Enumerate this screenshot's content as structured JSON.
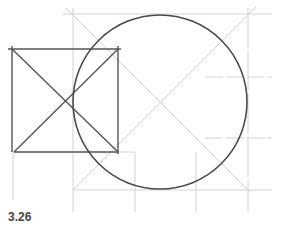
{
  "figure": {
    "caption": "3.26",
    "colors": {
      "construction_line": "#cfcfcf",
      "object_line": "#555555",
      "circle": "#4a4a4a",
      "caption": "#444444"
    },
    "square": {
      "x1": 12,
      "y1": 49,
      "x2": 118,
      "y2": 152
    },
    "circle": {
      "cx": 160,
      "cy": 102,
      "r": 87
    },
    "construction_box": {
      "x1": 73,
      "y1": 14,
      "x2": 248,
      "y2": 190
    },
    "guide_lines": {
      "vertical_x": [
        13,
        73,
        135,
        196,
        248
      ],
      "horizontal_y": [
        14,
        77,
        138,
        190
      ]
    }
  }
}
